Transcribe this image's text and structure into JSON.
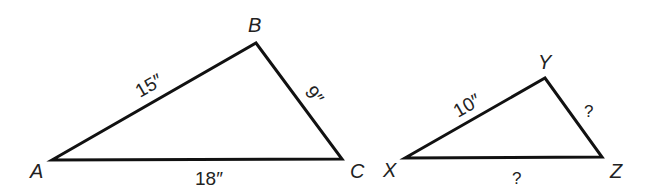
{
  "diagram": {
    "type": "similar-triangles",
    "triangles": [
      {
        "name": "ABC",
        "vertices": [
          {
            "label": "A",
            "x": 52,
            "y": 160
          },
          {
            "label": "B",
            "x": 256,
            "y": 43
          },
          {
            "label": "C",
            "x": 342,
            "y": 159
          }
        ],
        "sides": [
          {
            "between": "AB",
            "label": "15″"
          },
          {
            "between": "BC",
            "label": "9″"
          },
          {
            "between": "AC",
            "label": "18″"
          }
        ]
      },
      {
        "name": "XYZ",
        "vertices": [
          {
            "label": "X",
            "x": 405,
            "y": 158
          },
          {
            "label": "Y",
            "x": 545,
            "y": 78
          },
          {
            "label": "Z",
            "x": 602,
            "y": 157
          }
        ],
        "sides": [
          {
            "between": "XY",
            "label": "10″"
          },
          {
            "between": "YZ",
            "label": "?"
          },
          {
            "between": "XZ",
            "label": "?"
          }
        ]
      }
    ],
    "stroke_color": "#111111",
    "background": "#ffffff"
  }
}
